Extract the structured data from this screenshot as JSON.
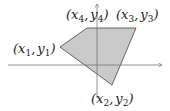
{
  "diagram": {
    "fill_color": "#c9c9c9",
    "stroke_color": "#555555",
    "axis_color": "#777777",
    "vertices": [
      {
        "id": "v1",
        "label_base_x": "x",
        "label_base_y": "y",
        "index": "1"
      },
      {
        "id": "v2",
        "label_base_x": "x",
        "label_base_y": "y",
        "index": "2"
      },
      {
        "id": "v3",
        "label_base_x": "x",
        "label_base_y": "y",
        "index": "3"
      },
      {
        "id": "v4",
        "label_base_x": "x",
        "label_base_y": "y",
        "index": "4"
      }
    ],
    "punct": {
      "open": "(",
      "comma": ",",
      "close": ")"
    }
  }
}
